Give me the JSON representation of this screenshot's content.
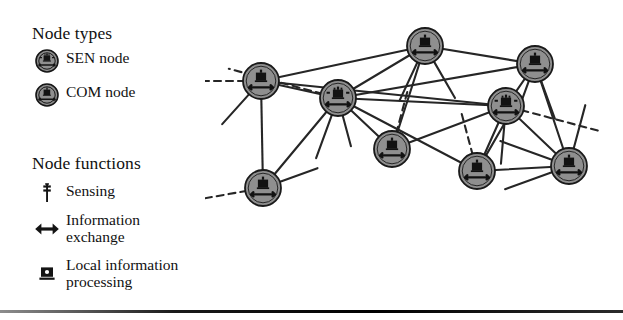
{
  "figure": {
    "background": "#ffffff",
    "node_fill": "#8f8f8f",
    "node_stroke": "#1a1a1a",
    "edge_color": "#262626",
    "rule_color": "#111111"
  },
  "legend": {
    "node_types": {
      "heading": "Node types",
      "items": [
        {
          "icon": "sen-node-icon",
          "label": "SEN node"
        },
        {
          "icon": "com-node-icon",
          "label": "COM node"
        }
      ]
    },
    "node_functions": {
      "heading": "Node functions",
      "items": [
        {
          "icon": "sensing-antenna-icon",
          "label": "Sensing"
        },
        {
          "icon": "bidirectional-arrow-icon",
          "label": "Information\nexchange"
        },
        {
          "icon": "processing-unit-icon",
          "label": "Local information\nprocessing"
        }
      ]
    }
  },
  "network": {
    "width": 418,
    "height": 212,
    "node_radius": 18,
    "nodes": [
      {
        "id": "n1",
        "type": "COM",
        "x": 56,
        "y": 73
      },
      {
        "id": "n2",
        "type": "SEN",
        "x": 133,
        "y": 90
      },
      {
        "id": "n3",
        "type": "COM",
        "x": 220,
        "y": 38
      },
      {
        "id": "n4",
        "type": "COM",
        "x": 330,
        "y": 56
      },
      {
        "id": "n5",
        "type": "SEN",
        "x": 301,
        "y": 98
      },
      {
        "id": "n6",
        "type": "COM",
        "x": 187,
        "y": 141
      },
      {
        "id": "n7",
        "type": "COM",
        "x": 58,
        "y": 180
      },
      {
        "id": "n8",
        "type": "COM",
        "x": 272,
        "y": 163
      },
      {
        "id": "n9",
        "type": "COM",
        "x": 364,
        "y": 158
      }
    ],
    "edges": [
      [
        "n1",
        "n2"
      ],
      [
        "n1",
        "n3"
      ],
      [
        "n1",
        "n7"
      ],
      [
        "n2",
        "n3"
      ],
      [
        "n2",
        "n4"
      ],
      [
        "n2",
        "n5"
      ],
      [
        "n2",
        "n6"
      ],
      [
        "n2",
        "n7"
      ],
      [
        "n2",
        "n8"
      ],
      [
        "n3",
        "n4"
      ],
      [
        "n3",
        "n6"
      ],
      [
        "n4",
        "n5"
      ],
      [
        "n4",
        "n9"
      ],
      [
        "n5",
        "n8"
      ],
      [
        "n5",
        "n9"
      ],
      [
        "n5",
        "n6"
      ],
      [
        "n8",
        "n9"
      ],
      [
        "n5",
        "n1"
      ]
    ],
    "stub_edges": [
      {
        "from": "n1",
        "angle": 180,
        "length": 50,
        "dashed": true
      },
      {
        "from": "n1",
        "angle": 228,
        "length": 40,
        "dashed": false
      },
      {
        "from": "n2",
        "angle": 285,
        "length": 32,
        "dashed": false
      },
      {
        "from": "n2",
        "angle": 250,
        "length": 46,
        "dashed": false
      },
      {
        "from": "n2",
        "angle": 165,
        "length": 95,
        "dashed": true
      },
      {
        "from": "n3",
        "angle": 245,
        "length": 42,
        "dashed": false
      },
      {
        "from": "n3",
        "angle": 300,
        "length": 42,
        "dashed": false
      },
      {
        "from": "n4",
        "angle": 250,
        "length": 38,
        "dashed": false
      },
      {
        "from": "n4",
        "angle": 290,
        "length": 40,
        "dashed": false
      },
      {
        "from": "n5",
        "angle": 265,
        "length": 40,
        "dashed": false
      },
      {
        "from": "n5",
        "angle": 345,
        "length": 80,
        "dashed": true
      },
      {
        "from": "n6",
        "angle": 75,
        "length": 42,
        "dashed": true
      },
      {
        "from": "n7",
        "angle": 190,
        "length": 50,
        "dashed": true
      },
      {
        "from": "n7",
        "angle": 20,
        "length": 40,
        "dashed": false
      },
      {
        "from": "n8",
        "angle": 105,
        "length": 45,
        "dashed": true
      },
      {
        "from": "n8",
        "angle": 60,
        "length": 40,
        "dashed": false
      },
      {
        "from": "n9",
        "angle": 75,
        "length": 45,
        "dashed": false
      },
      {
        "from": "n9",
        "angle": 200,
        "length": 50,
        "dashed": false
      },
      {
        "from": "n9",
        "angle": 160,
        "length": 55,
        "dashed": false
      }
    ]
  }
}
